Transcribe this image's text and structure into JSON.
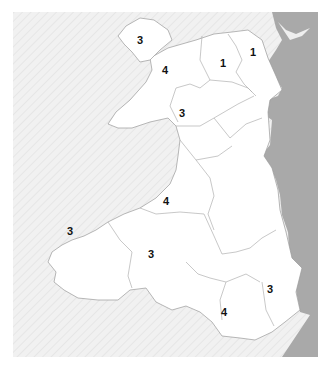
{
  "map": {
    "colors": {
      "sea": "#efefef",
      "england": "#a9a9a9",
      "wales": "#ffffff",
      "border": "#9a9a9a"
    },
    "regions": [
      {
        "id": "anglesey",
        "label": "3",
        "x": 141,
        "y": 40
      },
      {
        "id": "gwynedd-north",
        "label": "4",
        "x": 166,
        "y": 70
      },
      {
        "id": "conwy-denbigh",
        "label": "1",
        "x": 224,
        "y": 63
      },
      {
        "id": "flintshire",
        "label": "1",
        "x": 254,
        "y": 52
      },
      {
        "id": "gwynedd-south",
        "label": "3",
        "x": 183,
        "y": 113
      },
      {
        "id": "ceredigion",
        "label": "4",
        "x": 167,
        "y": 201
      },
      {
        "id": "pembrokeshire",
        "label": "3",
        "x": 71,
        "y": 231
      },
      {
        "id": "carmarthenshire",
        "label": "3",
        "x": 152,
        "y": 254
      },
      {
        "id": "gwent",
        "label": "3",
        "x": 271,
        "y": 289
      },
      {
        "id": "glamorgan",
        "label": "4",
        "x": 225,
        "y": 312
      }
    ]
  }
}
